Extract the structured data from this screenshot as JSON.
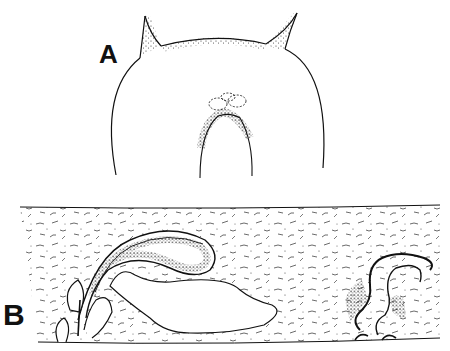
{
  "figure": {
    "panels": [
      {
        "id": "A",
        "label": "A",
        "description": "Head region outline with two pointed stippled horns and central stippled structure"
      },
      {
        "id": "B",
        "label": "B",
        "description": "Longitudinal section with coiled stippled tube, large clear sac, and paired openings at lower edge"
      }
    ],
    "cropped_top_caption": "",
    "colors": {
      "ink": "#111111",
      "background": "#ffffff",
      "stipple": "#333333"
    }
  }
}
